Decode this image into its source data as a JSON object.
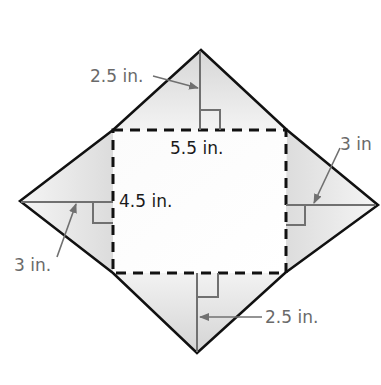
{
  "figure": {
    "colors": {
      "outline": "#111111",
      "dashed": "#111111",
      "height_line": "#707070",
      "label_dark": "#1a1a1a",
      "label_gray": "#6a6a6a",
      "flap_fill_light": "#f4f4f4",
      "flap_fill_dark": "#d8d8d8"
    },
    "base_rectangle": {
      "width_label": "5.5 in.",
      "height_label": "4.5 in."
    },
    "flaps": {
      "top": {
        "height_label": "2.5 in."
      },
      "bottom": {
        "height_label": "2.5 in."
      },
      "left": {
        "height_label": "3 in."
      },
      "right": {
        "height_label": "3 in"
      }
    }
  }
}
